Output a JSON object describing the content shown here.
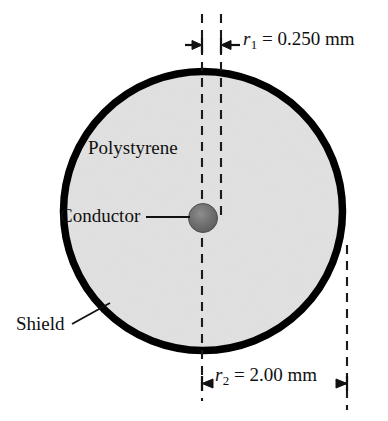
{
  "figure": {
    "labels": {
      "polystyrene": "Polystyrene",
      "conductor": "Conductor",
      "shield": "Shield"
    },
    "dimensions": {
      "inner": {
        "symbol": "r",
        "subscript": "1",
        "equals": "=",
        "value": "0.250",
        "unit": "mm",
        "full_text": "r1 = 0.250 mm"
      },
      "outer": {
        "symbol": "r",
        "subscript": "2",
        "equals": "=",
        "value": "2.00",
        "unit": "mm",
        "full_text": "r2 = 2.00 mm"
      }
    },
    "colors": {
      "background": "#ffffff",
      "shield_stroke": "#000000",
      "dielectric_fill": "#e9e9e9",
      "conductor_fill": "#6b6b6b",
      "dimension_line": "#1a1a1a",
      "text": "#101010"
    }
  }
}
